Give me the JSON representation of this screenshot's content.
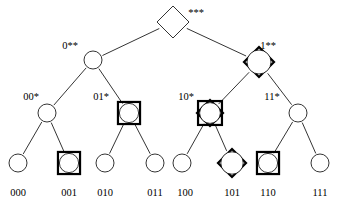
{
  "figure": {
    "name": "binary-prefix-tree",
    "type": "tree-diagram",
    "background_color": "#ffffff",
    "stroke_color": "#000000",
    "thin_stroke_width": 0.8,
    "bold_stroke_width": 2.2
  },
  "levels": [
    {
      "depth": 0,
      "y": 22
    },
    {
      "depth": 1,
      "y": 60
    },
    {
      "depth": 2,
      "y": 113
    },
    {
      "depth": 3,
      "y": 163
    }
  ],
  "nodes": [
    {
      "id": "root",
      "label": "***",
      "label_x": 196,
      "label_y": 13,
      "x": 173,
      "y": 22,
      "shapes": [
        "diamond-thin"
      ],
      "radius": 16
    },
    {
      "id": "0xx",
      "label": "0**",
      "label_x": 70,
      "label_y": 46,
      "x": 93,
      "y": 60,
      "shapes": [
        "circle-thin"
      ],
      "radius": 11
    },
    {
      "id": "1xx",
      "label": "1**",
      "label_x": 268,
      "label_y": 46,
      "x": 259,
      "y": 62,
      "shapes": [
        "diamond-bold",
        "circle-thin"
      ],
      "radius": 15
    },
    {
      "id": "00x",
      "label": "00*",
      "label_x": 31,
      "label_y": 97,
      "x": 47,
      "y": 113,
      "shapes": [
        "circle-thin"
      ],
      "radius": 11
    },
    {
      "id": "01x",
      "label": "01*",
      "label_x": 101,
      "label_y": 97,
      "x": 129,
      "y": 113,
      "shapes": [
        "square-bold",
        "circle-thin"
      ],
      "radius": 12
    },
    {
      "id": "10x",
      "label": "10*",
      "label_x": 186,
      "label_y": 97,
      "x": 210,
      "y": 113,
      "shapes": [
        "square-bold",
        "diamond-bold",
        "circle-thin"
      ],
      "radius": 13
    },
    {
      "id": "11x",
      "label": "11*",
      "label_x": 272,
      "label_y": 97,
      "x": 298,
      "y": 113,
      "shapes": [
        "circle-thin"
      ],
      "radius": 11
    },
    {
      "id": "000",
      "label": "000",
      "label_x": 18,
      "label_y": 193,
      "x": 18,
      "y": 163,
      "shapes": [
        "circle-thin"
      ],
      "radius": 11
    },
    {
      "id": "001",
      "label": "001",
      "label_x": 69,
      "label_y": 193,
      "x": 69,
      "y": 163,
      "shapes": [
        "square-bold",
        "circle-thin"
      ],
      "radius": 12
    },
    {
      "id": "010",
      "label": "010",
      "label_x": 105,
      "label_y": 193,
      "x": 105,
      "y": 163,
      "shapes": [
        "circle-thin"
      ],
      "radius": 11
    },
    {
      "id": "011",
      "label": "011",
      "label_x": 155,
      "label_y": 193,
      "x": 155,
      "y": 163,
      "shapes": [
        "circle-thin"
      ],
      "radius": 11
    },
    {
      "id": "100",
      "label": "100",
      "label_x": 185,
      "label_y": 193,
      "x": 182,
      "y": 163,
      "shapes": [
        "circle-thin"
      ],
      "radius": 11
    },
    {
      "id": "101",
      "label": "101",
      "label_x": 232,
      "label_y": 193,
      "x": 232,
      "y": 163,
      "shapes": [
        "diamond-bold",
        "circle-thin"
      ],
      "radius": 14
    },
    {
      "id": "110",
      "label": "110",
      "label_x": 268,
      "label_y": 193,
      "x": 268,
      "y": 163,
      "shapes": [
        "square-bold",
        "circle-thin"
      ],
      "radius": 12
    },
    {
      "id": "111",
      "label": "111",
      "label_x": 320,
      "label_y": 193,
      "x": 320,
      "y": 163,
      "shapes": [
        "circle-thin"
      ],
      "radius": 11
    }
  ],
  "edges": [
    {
      "from": "root",
      "to": "0xx"
    },
    {
      "from": "root",
      "to": "1xx"
    },
    {
      "from": "0xx",
      "to": "00x"
    },
    {
      "from": "0xx",
      "to": "01x"
    },
    {
      "from": "1xx",
      "to": "10x"
    },
    {
      "from": "1xx",
      "to": "11x"
    },
    {
      "from": "00x",
      "to": "000"
    },
    {
      "from": "00x",
      "to": "001"
    },
    {
      "from": "01x",
      "to": "010"
    },
    {
      "from": "01x",
      "to": "011"
    },
    {
      "from": "10x",
      "to": "100"
    },
    {
      "from": "10x",
      "to": "101"
    },
    {
      "from": "11x",
      "to": "110"
    },
    {
      "from": "11x",
      "to": "111"
    }
  ]
}
